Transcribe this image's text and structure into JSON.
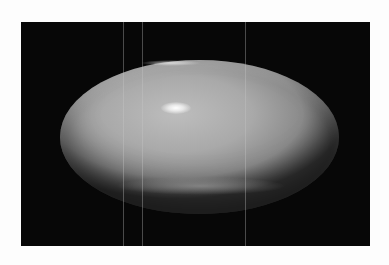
{
  "image": {
    "subject": "glossy oval object on black background",
    "colors": {
      "background": "#fdfdfd",
      "photo_background": "#070707",
      "object_light": "#bdbdbd",
      "object_dark": "#3a3a3a",
      "highlight": "#ffffff"
    },
    "artifacts": {
      "vertical_lines_x": [
        102,
        121,
        224
      ]
    }
  }
}
